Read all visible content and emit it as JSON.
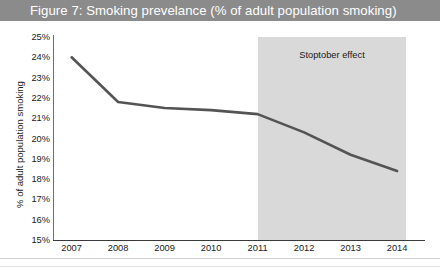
{
  "figure": {
    "title": "Figure 7: Smoking prevelance (% of adult population smoking)",
    "title_bar_color": "#8b8b8b",
    "title_text_color": "#ffffff",
    "background_color": "#ffffff"
  },
  "annotation": {
    "band_label": "Stoptober effect",
    "band_color": "#d9d9d9",
    "band_start_year": 2011,
    "band_end_year": 2014.2
  },
  "chart_data": {
    "type": "line",
    "title": "Figure 7: Smoking prevelance (% of adult population smoking)",
    "xlabel": "",
    "ylabel": "% of adult population smoking",
    "x": [
      2007,
      2008,
      2009,
      2010,
      2011,
      2012,
      2013,
      2014
    ],
    "x_tick_labels": [
      "2007",
      "2008",
      "2009",
      "2010",
      "2011",
      "2012",
      "2013",
      "2014"
    ],
    "y_tick_labels": [
      "25%",
      "24%",
      "23%",
      "22%",
      "21%",
      "20%",
      "19%",
      "18%",
      "17%",
      "16%",
      "15%"
    ],
    "y_ticks": [
      25,
      24,
      23,
      22,
      21,
      20,
      19,
      18,
      17,
      16,
      15
    ],
    "ylim": [
      15,
      25
    ],
    "xlim": [
      2006.6,
      2014.6
    ],
    "grid": false,
    "legend": false,
    "series": [
      {
        "name": "Smoking prevalence",
        "color": "#545454",
        "line_width": 2.6,
        "values": [
          24.0,
          21.8,
          21.5,
          21.4,
          21.2,
          20.3,
          19.2,
          18.4
        ]
      }
    ],
    "annotations": [
      {
        "text": "Stoptober effect",
        "type": "shaded-span",
        "x_start": 2011,
        "x_end": 2014.2,
        "color": "#d9d9d9"
      }
    ]
  }
}
